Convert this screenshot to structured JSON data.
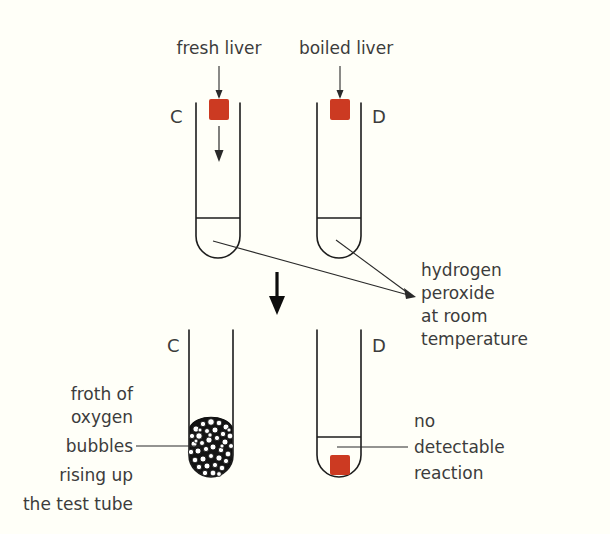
{
  "figure": {
    "background_color": "#fffff8",
    "ink_color": "#1d1d1d",
    "text_color": "#3c3c3c",
    "liver_color": "#cc3a22",
    "froth_color": "#111111"
  },
  "labels": {
    "fresh_liver": "fresh liver",
    "boiled_liver": "boiled liver",
    "hydrogen_peroxide": [
      "hydrogen",
      "peroxide",
      "at room",
      "temperature"
    ],
    "froth_of_oxygen": [
      "froth of",
      "oxygen",
      "bubbles",
      "rising up",
      "the test tube"
    ],
    "no_reaction": [
      "no",
      "detectable",
      "reaction"
    ]
  },
  "tubes": {
    "top_left_id": "C",
    "top_right_id": "D",
    "bottom_left_id": "C",
    "bottom_right_id": "D"
  }
}
